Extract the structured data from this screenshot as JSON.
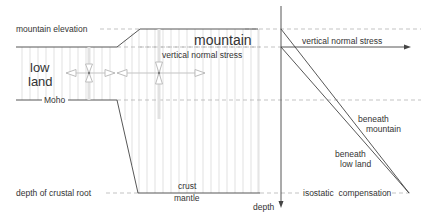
{
  "diagram": {
    "type": "isostasy cross-section with vertical normal stress vs depth profile",
    "colors": {
      "line": "#444444",
      "hatch": "#c8c8c8",
      "dashed": "#aaaaaa",
      "stress_arrow": "#bdbdbd",
      "text": "#333333"
    },
    "labels": {
      "mountain_elevation": "mountain elevation",
      "mountain": "mountain",
      "low_land_1": "low",
      "low_land_2": "land",
      "moho": "Moho",
      "vertical_normal_stress_inner": "vertical normal stress",
      "depth_of_crustal_root": "depth of crustal root",
      "crust": "crust",
      "mantle": "mantle",
      "vertical_normal_stress_axis": "vertical normal stress",
      "depth_axis": "depth",
      "beneath_mountain_1": "beneath",
      "beneath_mountain_2": "mountain",
      "beneath_low_land_1": "beneath",
      "beneath_low_land_2": "low land",
      "isostatic_compensation": "isostatic  compensation"
    },
    "icons": {
      "stress_cross_low_land": "stress-cross-icon",
      "stress_cross_mountain": "stress-cross-icon",
      "axis_arrow_right": "arrow-right-icon",
      "axis_arrow_down": "arrow-down-icon"
    }
  }
}
